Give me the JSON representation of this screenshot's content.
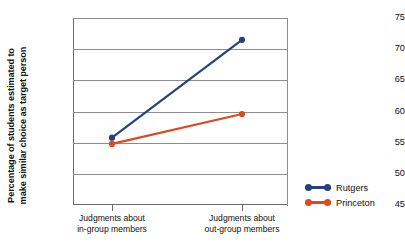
{
  "chart_data": {
    "type": "line",
    "title": "",
    "xlabel": "",
    "ylabel_line1": "Percentage of students estimated to",
    "ylabel_line2": "make similar choice as target person",
    "categories": [
      "Judgments about in-group members",
      "Judgments about out-group members"
    ],
    "category_lines": [
      [
        "Judgments about",
        "in-group members"
      ],
      [
        "Judgments about",
        "out-group members"
      ]
    ],
    "ylim": [
      45,
      75
    ],
    "yticks": [
      75,
      70,
      65,
      60,
      55,
      50,
      45
    ],
    "ytick_labels": [
      "75",
      "70",
      "65",
      "60",
      "55",
      "50",
      "45"
    ],
    "grid": true,
    "legend_position": "right",
    "series": [
      {
        "name": "Rutgers",
        "color": "#27407f",
        "values": [
          55.8,
          71.5
        ]
      },
      {
        "name": "Princeton",
        "color": "#dd4a1d",
        "values": [
          54.8,
          59.6
        ]
      }
    ]
  },
  "legend": {
    "items": [
      {
        "label": "Rutgers",
        "color": "#27407f"
      },
      {
        "label": "Princeton",
        "color": "#dd4a1d"
      }
    ]
  },
  "axis": {
    "y_title_line1": "Percentage of students estimated to",
    "y_title_line2": "make similar choice as target person",
    "ytick_0": "75",
    "ytick_1": "70",
    "ytick_2": "65",
    "ytick_3": "60",
    "ytick_4": "55",
    "ytick_5": "50",
    "ytick_6": "45",
    "xlabel_0_line1": "Judgments about",
    "xlabel_0_line2": "in-group members",
    "xlabel_1_line1": "Judgments about",
    "xlabel_1_line2": "out-group members"
  },
  "colors": {
    "rutgers": "#27407f",
    "princeton": "#dd4a1d",
    "axis": "#6b6b6b",
    "grid": "#8d8d8d",
    "text": "#111111",
    "background": "#ffffff"
  }
}
